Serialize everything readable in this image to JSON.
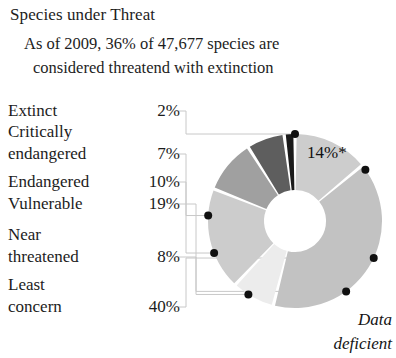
{
  "header": {
    "title": "Species under Threat",
    "subtitle_line1": "As of 2009, 36%  of 47,677 species are",
    "subtitle_line2": "considered threatend with extinction"
  },
  "legend": {
    "rows": [
      {
        "label": "Extinct",
        "value": "2%",
        "top": 0,
        "label_lines": 1
      },
      {
        "label": "Critically",
        "value": "",
        "top": 21,
        "label_lines": 1
      },
      {
        "label": "endangered",
        "value": "7%",
        "top": 43,
        "label_lines": 1
      },
      {
        "label": "Endangered",
        "value": "10%",
        "top": 71,
        "label_lines": 1
      },
      {
        "label": "Vulnerable",
        "value": "19%",
        "top": 93,
        "label_lines": 1
      },
      {
        "label": "Near",
        "value": "",
        "top": 124,
        "label_lines": 1
      },
      {
        "label": "threatened",
        "value": "8%",
        "top": 146,
        "label_lines": 1
      },
      {
        "label": "Least",
        "value": "",
        "top": 174,
        "label_lines": 1
      },
      {
        "label": "concern",
        "value": "40%",
        "top": 196,
        "label_lines": 1
      }
    ]
  },
  "callouts": {
    "data_deficient_pct": "14%*",
    "data_deficient_name_line1": "Data",
    "data_deficient_name_line2": "deficient"
  },
  "chart_data": {
    "type": "pie",
    "variant": "donut",
    "title": "Species under Threat",
    "subtitle": "As of 2009, 36% of 47,677 species are considered threatend with extinction",
    "unit": "percent",
    "total_species": 47677,
    "year": 2009,
    "threatened_share": "36%",
    "start_angle_deg": 0,
    "direction": "clockwise",
    "center": {
      "x": 295,
      "y": 221
    },
    "outer_radius": 87,
    "inner_radius": 31,
    "slice_gap_deg": 2.2,
    "categories": [
      "Data deficient",
      "Least concern",
      "Near threatened",
      "Vulnerable",
      "Endangered",
      "Critically endangered",
      "Extinct"
    ],
    "values": [
      14,
      40,
      8,
      19,
      10,
      7,
      2
    ],
    "labels": [
      "14%*",
      "40%",
      "8%",
      "19%",
      "10%",
      "7%",
      "2%"
    ],
    "colors": [
      "#cdcdcd",
      "#c2c2c2",
      "#ececec",
      "#cccccc",
      "#a0a0a0",
      "#5e5e5e",
      "#1a1a1a"
    ],
    "legend_position": "left",
    "grid": false,
    "leader_line_color": "#c8c8c8",
    "marker_color": "#101010",
    "footnote_marker": "*"
  }
}
